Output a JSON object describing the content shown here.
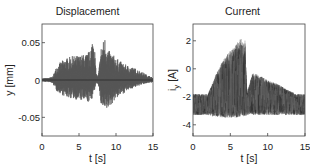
{
  "chart_data": [
    {
      "type": "line",
      "title": "Displacement",
      "xlabel": "t [s]",
      "ylabel": "y [mm]",
      "xlim": [
        0,
        15
      ],
      "ylim": [
        -0.075,
        0.075
      ],
      "xticks": [
        0,
        5,
        10,
        15
      ],
      "xtick_labels": [
        "0",
        "5",
        "10",
        "15"
      ],
      "yticks": [
        0.05,
        0,
        -0.05
      ],
      "ytick_labels": [
        "0.05",
        "0",
        "-0.05"
      ],
      "grid": false,
      "legend": null,
      "description": "Oscillating displacement signal; near zero for t<1.5 s, envelope grows to ~±0.03 between 2-6 s, spike to ~0.065 near t≈7 s, dip near t≈7.3 s, second burst 8-14 s with peak ~0.058 at t≈8.5 s and min ~-0.045 near t≈8.8 s, decaying to ~±0.01 by 14 s",
      "envelope": {
        "t": [
          0,
          1,
          1.5,
          2,
          3,
          4,
          5,
          6,
          6.5,
          7,
          7.3,
          7.6,
          8,
          8.5,
          9,
          10,
          11,
          12,
          13,
          14,
          15
        ],
        "upper": [
          0.002,
          0.003,
          0.005,
          0.02,
          0.028,
          0.032,
          0.033,
          0.035,
          0.04,
          0.065,
          0.01,
          0.005,
          0.045,
          0.058,
          0.04,
          0.03,
          0.022,
          0.018,
          0.014,
          0.008,
          0.003
        ],
        "lower": [
          -0.002,
          -0.003,
          -0.005,
          -0.015,
          -0.022,
          -0.025,
          -0.027,
          -0.03,
          -0.03,
          -0.02,
          -0.005,
          -0.005,
          -0.035,
          -0.045,
          -0.038,
          -0.025,
          -0.018,
          -0.012,
          -0.008,
          -0.005,
          -0.003
        ]
      }
    },
    {
      "type": "line",
      "title": "Current",
      "xlabel": "t [s]",
      "ylabel": "i_y [A]",
      "xlim": [
        0,
        15
      ],
      "ylim": [
        -4.8,
        3.2
      ],
      "xticks": [
        0,
        5,
        10,
        15
      ],
      "xtick_labels": [
        "0",
        "5",
        "10",
        "15"
      ],
      "yticks": [
        2,
        0,
        -2,
        -4
      ],
      "ytick_labels": [
        "2",
        "0",
        "-2",
        "-4"
      ],
      "grid": false,
      "legend": null,
      "description": "Many overlaid current traces; dense band between about -1.8 and -3.2 A for all t; from ~2.5 s to 7 s traces rise to ~+2.2 A at t≈6.5 s then drop sharply; second smaller hump from 8 s to 13 s starting near -0.3 A decaying to ~-1.8 A",
      "envelope": {
        "t": [
          0,
          2,
          2.5,
          3,
          4,
          5,
          6,
          6.5,
          7,
          7.2,
          8,
          9,
          10,
          11,
          12,
          13,
          14,
          15
        ],
        "upper": [
          -1.8,
          -1.8,
          -1.2,
          -0.5,
          0.6,
          1.3,
          1.9,
          2.2,
          2.0,
          -1.8,
          -0.3,
          -0.5,
          -0.8,
          -1.0,
          -1.3,
          -1.6,
          -1.8,
          -1.8
        ],
        "lower": [
          -3.3,
          -3.3,
          -3.4,
          -3.4,
          -3.5,
          -3.5,
          -3.5,
          -3.4,
          -3.4,
          -3.3,
          -3.3,
          -3.3,
          -3.3,
          -3.3,
          -3.3,
          -3.3,
          -3.3,
          -3.3
        ]
      }
    }
  ]
}
